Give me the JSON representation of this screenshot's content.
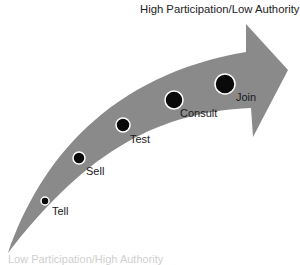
{
  "title": "High Participation/Low Authority",
  "bottom_label": "Low Participation/High Authority",
  "colors": {
    "arrow": "#8a8a8a",
    "dot": "#0a0a0a",
    "dot_ring": "#ffffff",
    "text": "#1a1a1a"
  },
  "stages": [
    {
      "label": "Tell",
      "x": 45,
      "y": 201,
      "r": 4,
      "lx": 52,
      "ly": 206
    },
    {
      "label": "Sell",
      "x": 79,
      "y": 158,
      "r": 6,
      "lx": 86,
      "ly": 166
    },
    {
      "label": "Test",
      "x": 123,
      "y": 125,
      "r": 7,
      "lx": 130,
      "ly": 134
    },
    {
      "label": "Consult",
      "x": 174,
      "y": 100,
      "r": 9,
      "lx": 180,
      "ly": 108
    },
    {
      "label": "Join",
      "x": 225,
      "y": 84,
      "r": 10,
      "lx": 236,
      "ly": 92
    }
  ]
}
